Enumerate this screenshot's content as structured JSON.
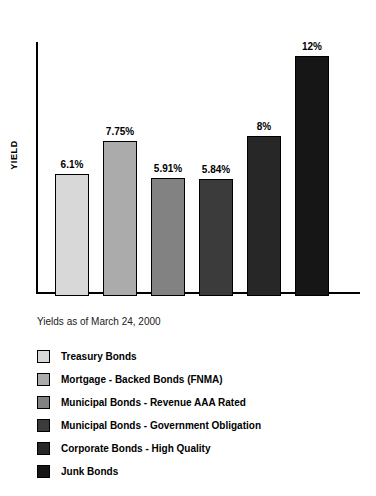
{
  "chart_data": {
    "type": "bar",
    "title": "",
    "xlabel": "",
    "ylabel": "YIELD",
    "grid": false,
    "legend_position": "below",
    "ylim": [
      0,
      12.5
    ],
    "categories": [
      "Treasury Bonds",
      "Mortgage - Backed Bonds (FNMA)",
      "Municipal Bonds - Revenue AAA Rated",
      "Municipal Bonds - Government Obligation",
      "Corporate Bonds - High Quality",
      "Junk Bonds"
    ],
    "values": [
      6.1,
      7.75,
      5.91,
      5.84,
      8,
      12
    ],
    "value_labels": [
      "6.1%",
      "7.75%",
      "5.91%",
      "5.84%",
      "8%",
      "12%"
    ],
    "colors": [
      "#d8d8d8",
      "#ababab",
      "#828282",
      "#3b3b3b",
      "#272727",
      "#161616"
    ]
  },
  "caption": "Yields as of March 24, 2000",
  "legend": {
    "items": [
      {
        "label": "Treasury Bonds",
        "color": "#d8d8d8"
      },
      {
        "label": "Mortgage - Backed Bonds (FNMA)",
        "color": "#ababab"
      },
      {
        "label": "Municipal Bonds - Revenue AAA Rated",
        "color": "#828282"
      },
      {
        "label": "Municipal Bonds - Government Obligation",
        "color": "#3b3b3b"
      },
      {
        "label": "Corporate Bonds - High Quality",
        "color": "#272727"
      },
      {
        "label": "Junk Bonds",
        "color": "#161616"
      }
    ]
  }
}
